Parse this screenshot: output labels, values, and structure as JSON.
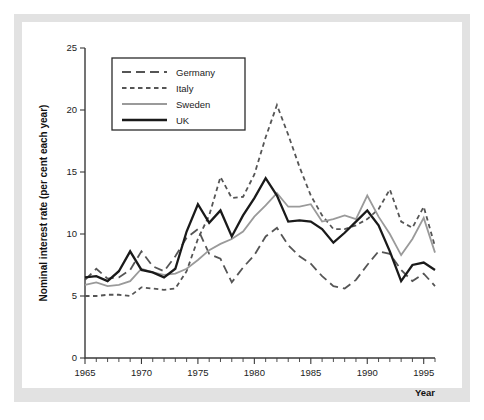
{
  "figure": {
    "background": "#e2e2e2",
    "plot_background": "#ffffff"
  },
  "chart_data": {
    "type": "line",
    "title": "",
    "xlabel": "Year",
    "ylabel": "Nominal interest rate (per cent each year)",
    "xlim": [
      1965,
      1996
    ],
    "ylim": [
      0,
      25
    ],
    "xticks": [
      1965,
      1970,
      1975,
      1980,
      1985,
      1990,
      1995
    ],
    "yticks": [
      0,
      5,
      10,
      15,
      20,
      25
    ],
    "minor_xticks_every": 1,
    "grid": false,
    "legend_position": "upper-left",
    "x": [
      1965,
      1966,
      1967,
      1968,
      1969,
      1970,
      1971,
      1972,
      1973,
      1974,
      1975,
      1976,
      1977,
      1978,
      1979,
      1980,
      1981,
      1982,
      1983,
      1984,
      1985,
      1986,
      1987,
      1988,
      1989,
      1990,
      1991,
      1992,
      1993,
      1994,
      1995,
      1996
    ],
    "series": [
      {
        "name": "Germany",
        "color": "#555555",
        "style": "long-dash",
        "width": 1.8,
        "values": [
          6.3,
          7.2,
          6.4,
          6.5,
          7.1,
          8.6,
          7.4,
          7.0,
          8.2,
          9.7,
          10.4,
          8.4,
          8.0,
          6.1,
          7.3,
          8.3,
          9.8,
          10.5,
          9.1,
          8.2,
          7.6,
          6.6,
          5.8,
          5.6,
          6.3,
          7.5,
          8.6,
          8.4,
          7.1,
          6.2,
          6.8,
          5.8
        ]
      },
      {
        "name": "Italy",
        "color": "#555555",
        "style": "short-dash",
        "width": 1.8,
        "values": [
          5.0,
          5.0,
          5.1,
          5.1,
          5.0,
          5.7,
          5.6,
          5.5,
          5.6,
          7.0,
          9.6,
          11.5,
          14.6,
          12.9,
          13.0,
          14.8,
          17.8,
          20.4,
          18.0,
          15.4,
          13.1,
          11.5,
          10.4,
          10.4,
          10.7,
          11.2,
          12.0,
          13.6,
          11.0,
          10.5,
          12.2,
          9.0
        ]
      },
      {
        "name": "Sweden",
        "color": "#9a9a9a",
        "style": "solid",
        "width": 1.8,
        "values": [
          5.9,
          6.1,
          5.8,
          5.9,
          6.2,
          7.2,
          6.9,
          6.7,
          6.8,
          7.2,
          7.9,
          8.7,
          9.2,
          9.6,
          10.2,
          11.4,
          12.3,
          13.3,
          12.2,
          12.2,
          12.4,
          11.0,
          11.2,
          11.5,
          11.2,
          13.1,
          11.4,
          10.0,
          8.3,
          9.6,
          11.3,
          8.5
        ]
      },
      {
        "name": "UK",
        "color": "#1a1a1a",
        "style": "solid",
        "width": 2.3,
        "values": [
          6.5,
          6.6,
          6.2,
          7.0,
          8.6,
          7.1,
          6.9,
          6.5,
          7.2,
          10.2,
          12.4,
          10.9,
          11.9,
          9.8,
          11.5,
          12.9,
          14.5,
          13.1,
          11.0,
          11.1,
          11.0,
          10.4,
          9.3,
          10.1,
          11.0,
          11.9,
          10.7,
          8.6,
          6.2,
          7.5,
          7.7,
          7.1
        ]
      }
    ]
  },
  "legend": {
    "items": [
      {
        "label": "Germany"
      },
      {
        "label": "Italy"
      },
      {
        "label": "Sweden"
      },
      {
        "label": "UK"
      }
    ]
  },
  "axes": {
    "y_title": "Nominal interest rate (per cent each year)",
    "x_title": "Year",
    "y_ticklabels": [
      "0",
      "5",
      "10",
      "15",
      "20",
      "25"
    ],
    "x_ticklabels": [
      "1965",
      "1970",
      "1975",
      "1980",
      "1985",
      "1990",
      "1995"
    ]
  }
}
